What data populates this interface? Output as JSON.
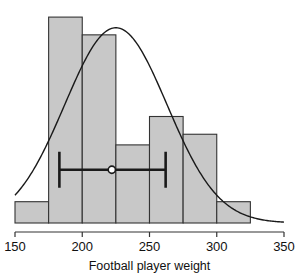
{
  "chart_data": {
    "type": "bar",
    "title": "",
    "subtitle": "",
    "xlabel": "Football player weight",
    "ylabel": "",
    "xlim": [
      150,
      350
    ],
    "ylim": [
      0,
      30
    ],
    "grid": false,
    "legend": null,
    "bin_width": 25,
    "bin_edges": [
      150,
      175,
      200,
      225,
      250,
      275,
      300,
      325
    ],
    "categories": [
      "150-175",
      "175-200",
      "200-225",
      "225-250",
      "250-275",
      "275-300",
      "300-325"
    ],
    "values": [
      3,
      29,
      26.5,
      11,
      15,
      12.5,
      3
    ],
    "bar_fill_color": "#c8c8c8",
    "bar_edge_color": "#333333",
    "x_ticks": [
      {
        "value": 150,
        "label": "150"
      },
      {
        "value": 200,
        "label": "200"
      },
      {
        "value": 250,
        "label": "250"
      },
      {
        "value": 300,
        "label": "300"
      },
      {
        "value": 350,
        "label": "350"
      }
    ],
    "overlays": [
      {
        "type": "line",
        "name": "normal-density-curve",
        "color": "#1a1a1a",
        "mean": 225,
        "peak_value": 27.5,
        "x_start": 150,
        "x_end": 350
      },
      {
        "type": "errorbar",
        "name": "confidence-interval",
        "color": "#1a1a1a",
        "center": 222,
        "lower": 183,
        "upper": 262,
        "y_position": 7.5,
        "marker": "open-circle"
      }
    ]
  },
  "axis": {
    "x_title": "Football player weight",
    "tick_labels": [
      "150",
      "200",
      "250",
      "300",
      "350"
    ]
  },
  "colors": {
    "bar_fill": "#c8c8c8",
    "bar_edge": "#333333",
    "curve": "#1a1a1a",
    "errorbar": "#1a1a1a",
    "axis": "#333333",
    "text": "#111111",
    "background": "#ffffff"
  }
}
